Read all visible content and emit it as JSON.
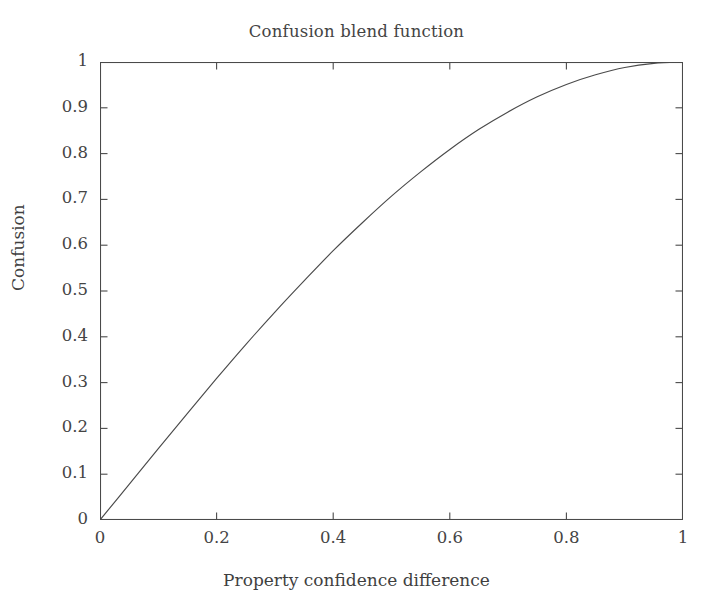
{
  "figure": {
    "background_color": "#ffffff",
    "axis_color": "#4a4a4a",
    "curve_color": "#4a4a4a",
    "text_color": "#3f3f3f"
  },
  "chart_data": {
    "type": "line",
    "title": "Confusion blend function",
    "xlabel": "Property confidence difference",
    "ylabel": "Confusion",
    "xlim": [
      0,
      1
    ],
    "ylim": [
      0,
      1
    ],
    "grid": false,
    "legend": null,
    "xticks": [
      0,
      0.2,
      0.4,
      0.6,
      0.8,
      1
    ],
    "xtick_labels": [
      "0",
      "0.2",
      "0.4",
      "0.6",
      "0.8",
      "1"
    ],
    "yticks": [
      0,
      0.1,
      0.2,
      0.3,
      0.4,
      0.5,
      0.6,
      0.7,
      0.8,
      0.9,
      1
    ],
    "ytick_labels": [
      "0",
      "0.1",
      "0.2",
      "0.3",
      "0.4",
      "0.5",
      "0.6",
      "0.7",
      "0.8",
      "0.9",
      "1"
    ],
    "tick_direction": "in",
    "frame": "box",
    "series": [
      {
        "name": "Confusion blend",
        "x": [
          0.0,
          0.05,
          0.1,
          0.15,
          0.2,
          0.25,
          0.3,
          0.35,
          0.4,
          0.45,
          0.5,
          0.55,
          0.6,
          0.65,
          0.7,
          0.75,
          0.8,
          0.85,
          0.9,
          0.95,
          1.0
        ],
        "y": [
          0.0,
          0.078,
          0.156,
          0.233,
          0.309,
          0.383,
          0.454,
          0.522,
          0.588,
          0.649,
          0.707,
          0.76,
          0.809,
          0.853,
          0.891,
          0.924,
          0.951,
          0.972,
          0.988,
          0.997,
          1.0
        ]
      }
    ]
  }
}
